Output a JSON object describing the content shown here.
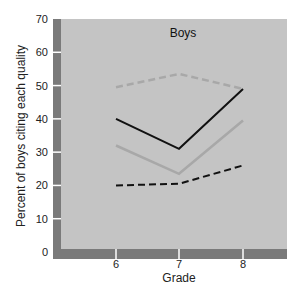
{
  "chart_data": {
    "type": "line",
    "title": "Boys",
    "xlabel": "Grade",
    "ylabel": "Percent of boys citing each quality",
    "x": [
      6,
      7,
      8
    ],
    "categories": [
      "6",
      "7",
      "8"
    ],
    "ylim": [
      0,
      70
    ],
    "yticks": [
      0,
      10,
      20,
      30,
      40,
      50,
      60,
      70
    ],
    "grid": false,
    "legend": null,
    "series": [
      {
        "name": "gray dashed",
        "style": "dashed",
        "color": "#a8a8a8",
        "values": [
          49.5,
          53.5,
          49
        ]
      },
      {
        "name": "black solid",
        "style": "solid",
        "color": "#111111",
        "values": [
          40,
          31,
          49
        ]
      },
      {
        "name": "gray solid",
        "style": "solid",
        "color": "#a8a8a8",
        "values": [
          32,
          23.5,
          39.5
        ]
      },
      {
        "name": "black dashed",
        "style": "dashed",
        "color": "#111111",
        "values": [
          20,
          20.5,
          26
        ]
      }
    ]
  },
  "colors": {
    "plot_background": "#c4c4c4",
    "frame": "#7a7a7a",
    "tick_mark": "#ffffff"
  }
}
